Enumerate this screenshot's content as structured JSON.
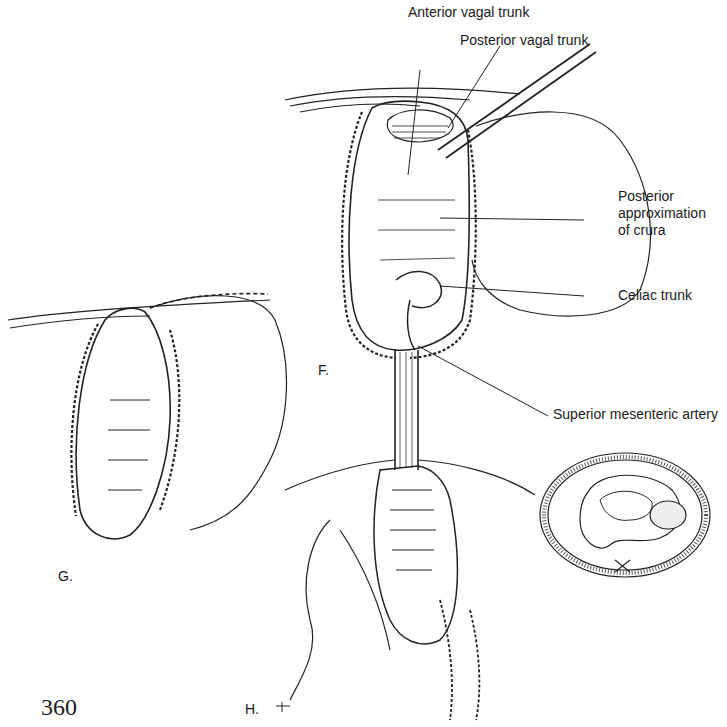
{
  "figure": {
    "panels": [
      {
        "id": "F",
        "label": "F."
      },
      {
        "id": "G",
        "label": "G."
      },
      {
        "id": "H",
        "label": "H."
      }
    ],
    "callouts": [
      {
        "text": "Anterior vagal trunk"
      },
      {
        "text": "Posterior vagal trunk"
      },
      {
        "text": "Posterior\napproximation\nof crura",
        "lines": [
          "Posterior",
          "approximation",
          "of crura"
        ]
      },
      {
        "text": "Celiac trunk"
      },
      {
        "text": "Superior mesenteric artery"
      }
    ],
    "page_number": "360"
  }
}
